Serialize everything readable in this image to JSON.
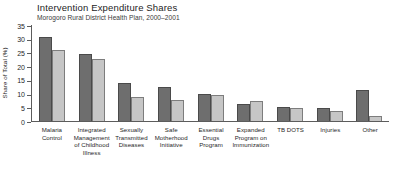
{
  "chart_data": {
    "type": "bar",
    "title": "Intervention Expenditure Shares",
    "subtitle": "Morogoro Rural District Health Plan, 2000–2001",
    "xlabel": "",
    "ylabel": "Share of Total (%)",
    "ylim": [
      0,
      35
    ],
    "yticks": [
      0,
      5,
      10,
      15,
      20,
      25,
      30,
      35
    ],
    "grid": false,
    "legend": "none",
    "categories": [
      "Malaria Control",
      "Integrated Management of Childhood Illness",
      "Sexually Transmitted Diseases",
      "Safe Motherhood Initiative",
      "Essential Drugs Program",
      "Expanded Program on Immunization",
      "TB DOTS",
      "Injuries",
      "Other"
    ],
    "series": [
      {
        "name": "series-1",
        "color": "#6e6e6e",
        "values": [
          30.5,
          24.5,
          14.0,
          12.3,
          9.8,
          6.2,
          5.0,
          4.8,
          11.2
        ]
      },
      {
        "name": "series-2",
        "color": "#c6c6c6",
        "values": [
          26.0,
          22.7,
          8.7,
          7.5,
          9.5,
          7.4,
          4.7,
          3.6,
          1.8
        ]
      }
    ]
  },
  "category_lines": [
    [
      "Malaria",
      "Control"
    ],
    [
      "Integrated",
      "Management",
      "of Childhood",
      "Illness"
    ],
    [
      "Sexually",
      "Transmitted",
      "Diseases"
    ],
    [
      "Safe",
      "Motherhood",
      "Initiative"
    ],
    [
      "Essential",
      "Drugs",
      "Program"
    ],
    [
      "Expanded",
      "Program on",
      "Immunization"
    ],
    [
      "TB DOTS"
    ],
    [
      "Injuries"
    ],
    [
      "Other"
    ]
  ]
}
